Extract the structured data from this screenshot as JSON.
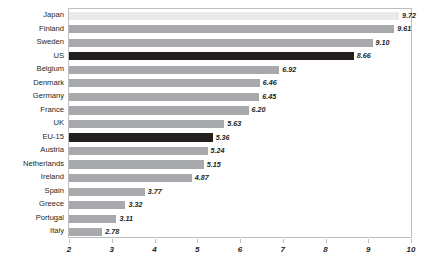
{
  "chart_data": {
    "type": "bar",
    "orientation": "horizontal",
    "title": "",
    "xlabel": "",
    "ylabel": "",
    "xlim": [
      2,
      10
    ],
    "xticks": [
      "2",
      "3",
      "4",
      "5",
      "6",
      "7",
      "8",
      "9",
      "10"
    ],
    "grid": false,
    "legend": "none",
    "categories": [
      "Japan",
      "Finland",
      "Sweden",
      "US",
      "Belgium",
      "Denmark",
      "Germany",
      "France",
      "UK",
      "EU-15",
      "Austria",
      "Netherlands",
      "Ireland",
      "Spain",
      "Greece",
      "Portugal",
      "Italy"
    ],
    "values": [
      9.72,
      9.61,
      9.1,
      8.66,
      6.92,
      6.46,
      6.45,
      6.2,
      5.63,
      5.36,
      5.24,
      5.15,
      4.87,
      3.77,
      3.32,
      3.11,
      2.78
    ],
    "value_labels": [
      "9.72",
      "9.61",
      "9.10",
      "8.66",
      "6.92",
      "6.46",
      "6.45",
      "6.20",
      "5.63",
      "5.36",
      "5.24",
      "5.15",
      "4.87",
      "3.77",
      "3.32",
      "3.11",
      "2.78"
    ],
    "bar_styles": [
      "light",
      "normal",
      "normal",
      "dark",
      "normal",
      "normal",
      "normal",
      "normal",
      "normal",
      "dark",
      "normal",
      "normal",
      "normal",
      "normal",
      "normal",
      "normal",
      "normal"
    ]
  },
  "colors": {
    "bar_default": "#a7a9ac",
    "bar_highlight": "#231f20",
    "bar_light": "#e9eaea",
    "axis": "#bcbec0",
    "text": "#231f20",
    "background": "#ffffff"
  }
}
